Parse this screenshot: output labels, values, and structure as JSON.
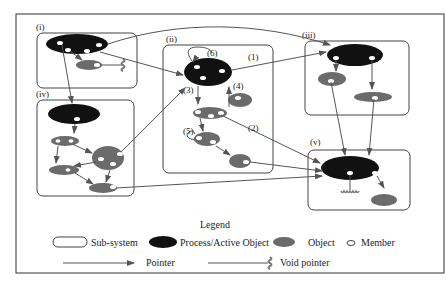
{
  "diagram": {
    "subsystems": [
      {
        "id": "i",
        "label": "(i)"
      },
      {
        "id": "ii",
        "label": "(ii)"
      },
      {
        "id": "iii",
        "label": "(iii)"
      },
      {
        "id": "iv",
        "label": "(iv)"
      },
      {
        "id": "v",
        "label": "(v)"
      }
    ],
    "annotations": [
      "(1)",
      "(2)",
      "(3)",
      "(4)",
      "(5)",
      "(6)"
    ]
  },
  "legend": {
    "title": "Legend",
    "items": [
      {
        "icon": "subsystem-icon",
        "label": "Sub-system"
      },
      {
        "icon": "process-active-object-icon",
        "label": "Process/Active Object"
      },
      {
        "icon": "object-icon",
        "label": "Object"
      },
      {
        "icon": "member-icon",
        "label": "Member"
      },
      {
        "icon": "pointer-arrow-icon",
        "label": "Pointer"
      },
      {
        "icon": "void-pointer-icon",
        "label": "Void pointer"
      }
    ]
  },
  "colors": {
    "process": "#111111",
    "object": "#6b6b6b",
    "member": "#ffffff",
    "line": "#444444"
  }
}
